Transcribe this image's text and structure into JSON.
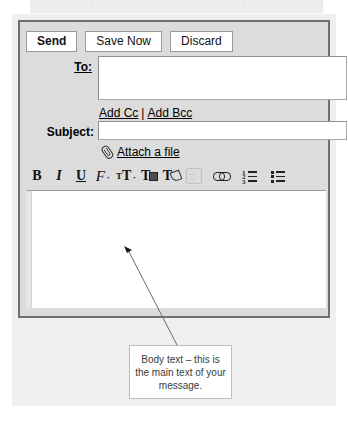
{
  "window": {
    "title": "Compose Mail"
  },
  "actions": [
    {
      "label": "Send",
      "name": "send-button",
      "primary": true
    },
    {
      "label": "Save Now",
      "name": "save-now-button",
      "primary": false
    },
    {
      "label": "Discard",
      "name": "discard-button",
      "primary": false
    }
  ],
  "fields": {
    "to": {
      "label": "To:",
      "value": "",
      "placeholder": ""
    },
    "subject": {
      "label": "Subject:",
      "value": "",
      "placeholder": ""
    }
  },
  "recipient_links": {
    "add_cc": "Add Cc",
    "separator": "|",
    "add_bcc": "Add Bcc"
  },
  "attach": {
    "label": "Attach a file",
    "icon": "paperclip-icon"
  },
  "format_toolbar": [
    {
      "name": "bold-icon",
      "glyph": "B",
      "kind": "text-b",
      "dim": false
    },
    {
      "name": "italic-icon",
      "glyph": "I",
      "kind": "text-i",
      "dim": false
    },
    {
      "name": "underline-icon",
      "glyph": "U",
      "kind": "text-u",
      "dim": false
    },
    {
      "name": "font-family-icon",
      "glyph": "F",
      "kind": "font",
      "dim": false
    },
    {
      "name": "font-size-icon",
      "glyph": "T",
      "kind": "size",
      "dim": false
    },
    {
      "name": "text-color-icon",
      "glyph": "T",
      "kind": "color",
      "dim": false
    },
    {
      "name": "text-highlight-icon",
      "glyph": "T",
      "kind": "pen",
      "dim": false
    },
    {
      "name": "emoticon-icon",
      "glyph": "",
      "kind": "smiley",
      "dim": true
    },
    {
      "name": "insert-link-icon",
      "glyph": "",
      "kind": "chain",
      "dim": false
    },
    {
      "name": "numbered-list-icon",
      "glyph": "",
      "kind": "numlist",
      "dim": false
    },
    {
      "name": "bulleted-list-icon",
      "glyph": "",
      "kind": "bullist",
      "dim": false
    }
  ],
  "body": {
    "value": ""
  },
  "annotation": {
    "text": "Body text – this is the main text of your message.",
    "pointer_target": "message-body-area"
  },
  "colors": {
    "window_border": "#6f6f6f",
    "window_background": "#dcdcdc",
    "page_background": "#efefef",
    "field_background": "#ffffff",
    "annotation_text": "#3b3b3b",
    "annotation_border": "#bdbdbd"
  }
}
